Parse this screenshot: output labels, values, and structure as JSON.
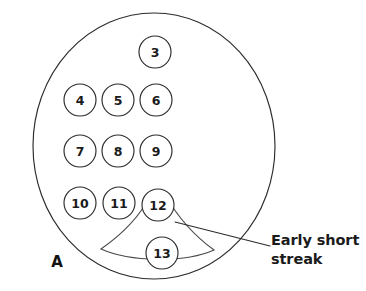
{
  "figure": {
    "panel_letter": "A",
    "colors": {
      "outline": "#2b2b2b",
      "streak": "#4a4a4a",
      "text": "#1b1b1b",
      "background": "#ffffff"
    },
    "plate": {
      "center_x": 154,
      "center_y": 146,
      "radius": 121
    },
    "colonies": [
      {
        "id": "colony-3",
        "label": "3",
        "cx": 155,
        "cy": 52,
        "r": 16
      },
      {
        "id": "colony-4",
        "label": "4",
        "cx": 80,
        "cy": 100,
        "r": 16
      },
      {
        "id": "colony-5",
        "label": "5",
        "cx": 118,
        "cy": 100,
        "r": 16
      },
      {
        "id": "colony-6",
        "label": "6",
        "cx": 156,
        "cy": 100,
        "r": 16
      },
      {
        "id": "colony-7",
        "label": "7",
        "cx": 80,
        "cy": 151,
        "r": 16
      },
      {
        "id": "colony-8",
        "label": "8",
        "cx": 118,
        "cy": 151,
        "r": 16
      },
      {
        "id": "colony-9",
        "label": "9",
        "cx": 156,
        "cy": 151,
        "r": 16
      },
      {
        "id": "colony-10",
        "label": "10",
        "cx": 80,
        "cy": 203,
        "r": 16
      },
      {
        "id": "colony-11",
        "label": "11",
        "cx": 119,
        "cy": 203,
        "r": 16
      },
      {
        "id": "colony-12",
        "label": "12",
        "cx": 158,
        "cy": 205,
        "r": 16
      },
      {
        "id": "colony-13",
        "label": "13",
        "cx": 162,
        "cy": 253,
        "r": 16
      }
    ],
    "annotations": [
      {
        "id": "early-short-streak",
        "lines": [
          "Early short",
          "streak"
        ],
        "text": "Early short\nstreak",
        "leader_from_x": 175,
        "leader_from_y": 222,
        "leader_to_x": 270,
        "leader_to_y": 246
      }
    ]
  }
}
